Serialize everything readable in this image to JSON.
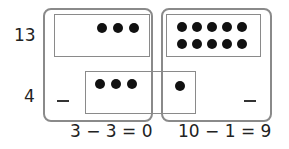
{
  "diagram": {
    "row_labels": {
      "top": "13",
      "bottom": "4"
    },
    "top_left_dots": 3,
    "top_right_dots": 10,
    "bottom_left_dots": 3,
    "bottom_right_dots": 1,
    "minus_symbols": [
      "−",
      "−"
    ],
    "equations": {
      "left": "3 − 3 = 0",
      "right": "10 − 1 = 9"
    },
    "colors": {
      "frame": "#8a8a8a",
      "dot": "#111111",
      "text": "#222222"
    }
  }
}
